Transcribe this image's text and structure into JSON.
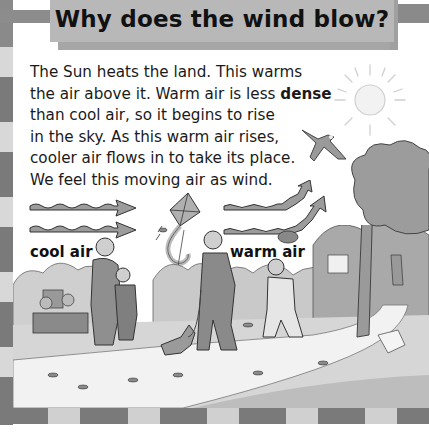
{
  "title": "Why does the wind blow?",
  "paragraph": {
    "lines": [
      "The Sun heats the land. This warms",
      "the air above it. Warm air is less ",
      "than cool air, so it begins to rise",
      "in the sky. As this warm air rises,",
      "cooler air flows in to take its place.",
      "We feel this moving air as wind."
    ],
    "bold_word": "dense"
  },
  "diagram": {
    "cool_air_label": "cool air",
    "warm_air_label": "warm air"
  },
  "illustration": {
    "elements": [
      "sun",
      "bird",
      "kite",
      "trees",
      "family walking",
      "dog",
      "people on bench",
      "person on path",
      "blowing leaves",
      "blowing hat",
      "blowing paper"
    ]
  },
  "colors": {
    "title_banner": "#b8b8b8",
    "border_dark": "#7a7a7a",
    "border_light": "#d0d0d0",
    "text": "#1a1a1a"
  }
}
